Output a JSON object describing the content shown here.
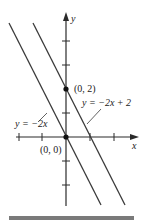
{
  "diagram": {
    "type": "coordinate-plane",
    "axes": {
      "x_label": "x",
      "y_label": "y",
      "unit_px": 24
    },
    "points": [
      {
        "label": "(0, 2)",
        "x": 0,
        "y": 2
      },
      {
        "label": "(0, 0)",
        "x": 0,
        "y": 0
      }
    ],
    "lines": [
      {
        "label": "y = −2x",
        "slope": -2,
        "intercept": 0
      },
      {
        "label": "y = −2x + 2",
        "slope": -2,
        "intercept": 2
      }
    ],
    "colors": {
      "line": "#3a3a3a",
      "axis": "#2a2a2a",
      "bar": "#7a7a7a"
    }
  }
}
